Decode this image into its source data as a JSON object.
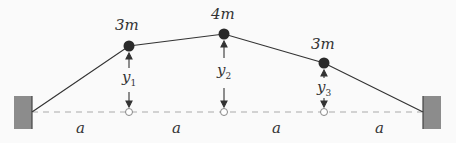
{
  "diagram": {
    "masses": [
      {
        "label": "3m",
        "y_label": "y",
        "y_sub": "1"
      },
      {
        "label": "4m",
        "y_label": "y",
        "y_sub": "2"
      },
      {
        "label": "3m",
        "y_label": "y",
        "y_sub": "3"
      }
    ],
    "spacings": [
      "a",
      "a",
      "a",
      "a"
    ],
    "colors": {
      "line": "#333333",
      "mass": "#2a2a2a",
      "wall": "#8c8c8c",
      "dashed": "#aaaaaa"
    }
  }
}
